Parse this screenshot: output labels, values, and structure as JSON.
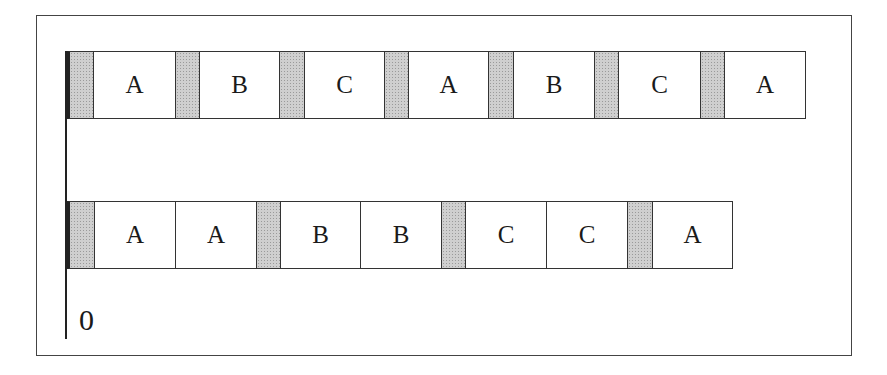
{
  "diagram": {
    "axis_label": "0",
    "colors": {
      "gap_fill": "#cfcfcf",
      "cell_fill": "#ffffff",
      "border": "#333333"
    },
    "rows": [
      {
        "name": "interleaved-schedule",
        "top": 51,
        "cells": [
          {
            "type": "gap",
            "label": "",
            "x": 67,
            "w": 26
          },
          {
            "type": "task",
            "label": "A",
            "x": 93,
            "w": 82
          },
          {
            "type": "gap",
            "label": "",
            "x": 175,
            "w": 24
          },
          {
            "type": "task",
            "label": "B",
            "x": 199,
            "w": 80
          },
          {
            "type": "gap",
            "label": "",
            "x": 279,
            "w": 25
          },
          {
            "type": "task",
            "label": "C",
            "x": 304,
            "w": 80
          },
          {
            "type": "gap",
            "label": "",
            "x": 384,
            "w": 24
          },
          {
            "type": "task",
            "label": "A",
            "x": 408,
            "w": 80
          },
          {
            "type": "gap",
            "label": "",
            "x": 488,
            "w": 25
          },
          {
            "type": "task",
            "label": "B",
            "x": 513,
            "w": 81
          },
          {
            "type": "gap",
            "label": "",
            "x": 594,
            "w": 24
          },
          {
            "type": "task",
            "label": "C",
            "x": 618,
            "w": 82
          },
          {
            "type": "gap",
            "label": "",
            "x": 700,
            "w": 24
          },
          {
            "type": "task",
            "label": "A",
            "x": 724,
            "w": 81
          }
        ]
      },
      {
        "name": "grouped-schedule",
        "top": 201,
        "cells": [
          {
            "type": "gap",
            "label": "",
            "x": 67,
            "w": 27
          },
          {
            "type": "task",
            "label": "A",
            "x": 94,
            "w": 81
          },
          {
            "type": "task",
            "label": "A",
            "x": 175,
            "w": 81
          },
          {
            "type": "gap",
            "label": "",
            "x": 256,
            "w": 24
          },
          {
            "type": "task",
            "label": "B",
            "x": 280,
            "w": 80
          },
          {
            "type": "task",
            "label": "B",
            "x": 360,
            "w": 81
          },
          {
            "type": "gap",
            "label": "",
            "x": 441,
            "w": 24
          },
          {
            "type": "task",
            "label": "C",
            "x": 465,
            "w": 81
          },
          {
            "type": "task",
            "label": "C",
            "x": 546,
            "w": 81
          },
          {
            "type": "gap",
            "label": "",
            "x": 627,
            "w": 25
          },
          {
            "type": "task",
            "label": "A",
            "x": 652,
            "w": 80
          }
        ]
      }
    ]
  }
}
